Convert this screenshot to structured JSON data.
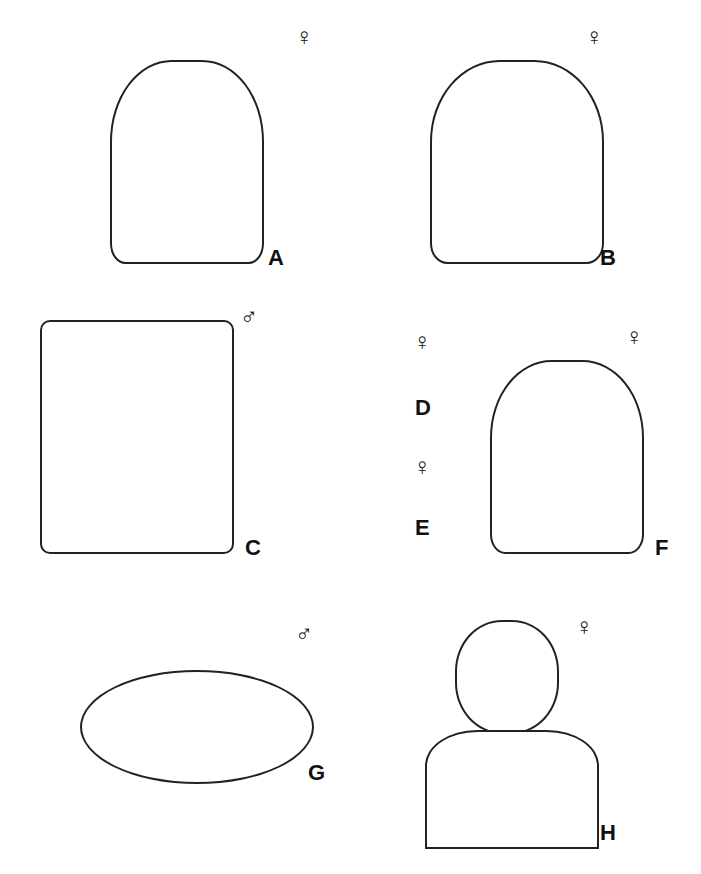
{
  "plate": {
    "panels": [
      {
        "id": "A",
        "label": "A",
        "sex": "♀"
      },
      {
        "id": "B",
        "label": "B",
        "sex": "♀"
      },
      {
        "id": "C",
        "label": "C",
        "sex": "♂"
      },
      {
        "id": "D",
        "label": "D",
        "sex": "♀"
      },
      {
        "id": "E",
        "label": "E",
        "sex": "♀"
      },
      {
        "id": "F",
        "label": "F",
        "sex": "♀"
      },
      {
        "id": "G",
        "label": "G",
        "sex": "♂"
      },
      {
        "id": "H",
        "label": "H",
        "sex": "♀"
      }
    ]
  }
}
